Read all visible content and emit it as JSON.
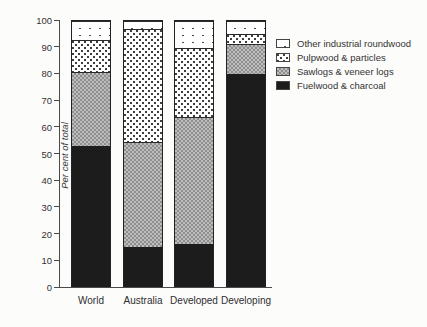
{
  "chart_data": {
    "type": "bar",
    "stacked": true,
    "title": "",
    "xlabel": "",
    "ylabel": "Per cent of total",
    "ylim": [
      0,
      100
    ],
    "yticks": [
      0,
      10,
      20,
      30,
      40,
      50,
      60,
      70,
      80,
      90,
      100
    ],
    "grid": false,
    "categories": [
      "World",
      "Australia",
      "Developed",
      "Developing"
    ],
    "series": [
      {
        "name": "Fuelwood & charcoal",
        "pattern": "solid-black",
        "values": [
          53,
          15,
          16,
          80
        ]
      },
      {
        "name": "Sawlogs & veneer logs",
        "pattern": "gray-check",
        "values": [
          28,
          39.5,
          48,
          11.5
        ]
      },
      {
        "name": "Pulpwood & particles",
        "pattern": "dense-dots",
        "values": [
          12,
          42.5,
          26,
          3.5
        ]
      },
      {
        "name": "Other industrial roundwood",
        "pattern": "sparse-dots",
        "values": [
          7,
          3,
          10,
          5
        ]
      }
    ],
    "cumulative_tops": {
      "World": [
        53,
        81,
        93,
        100
      ],
      "Australia": [
        15,
        54.5,
        97,
        100
      ],
      "Developed": [
        16,
        64,
        90,
        100
      ],
      "Developing": [
        80,
        91.5,
        95,
        100
      ]
    },
    "legend": {
      "position": "top-right",
      "entries": [
        "Other industrial roundwood",
        "Pulpwood & particles",
        "Sawlogs & veneer logs",
        "Fuelwood & charcoal"
      ]
    }
  },
  "colors": {
    "fuelwood_black": "#1c1c1c",
    "sawlogs_gray_dark": "#8e8e8e",
    "sawlogs_gray_light": "#bdbdbd",
    "dot_color": "#3f3f3f",
    "axis": "#4a4a4a",
    "text": "#333333",
    "background": "#fcfcfb"
  }
}
